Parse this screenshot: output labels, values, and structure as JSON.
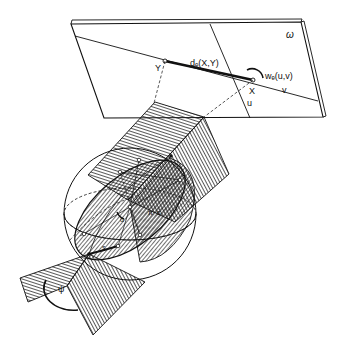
{
  "figure": {
    "labels": {
      "plane": "ω",
      "point_y": "Y",
      "point_x": "X",
      "distance": "dₑ(X,Y)",
      "angle_uv": "wₑ(u,v)",
      "dir_u": "u",
      "dir_v": "v",
      "arc_s": "s",
      "arc_pi_minus_s": "π−s",
      "angle_alpha": "α",
      "dihedral": "ψ"
    },
    "colors": {
      "ink": "#111111",
      "background": "#ffffff"
    }
  }
}
